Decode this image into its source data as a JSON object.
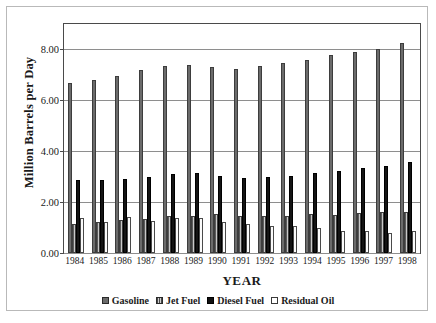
{
  "chart_data": {
    "type": "bar",
    "title": "",
    "xlabel": "YEAR",
    "ylabel": "Million Barrels per Day",
    "categories": [
      "1984",
      "1985",
      "1986",
      "1987",
      "1988",
      "1989",
      "1990",
      "1991",
      "1992",
      "1993",
      "1994",
      "1995",
      "1996",
      "1997",
      "1998"
    ],
    "ylim": [
      0.0,
      9.0
    ],
    "yticks": [
      "0.00",
      "2.00",
      "4.00",
      "6.00",
      "8.00"
    ],
    "ytick_values": [
      0.0,
      2.0,
      4.0,
      6.0,
      8.0
    ],
    "grid": true,
    "legend_position": "bottom",
    "series": [
      {
        "name": "Gasoline",
        "color": "#6b6b6b",
        "pattern": "solid-dark-gray",
        "values": [
          6.69,
          6.8,
          6.95,
          7.19,
          7.34,
          7.37,
          7.31,
          7.24,
          7.36,
          7.46,
          7.6,
          7.79,
          7.89,
          8.02,
          8.25
        ]
      },
      {
        "name": "Jet Fuel",
        "color": "#9a9a9a",
        "pattern": "vertical-hatch-gray",
        "values": [
          1.15,
          1.2,
          1.28,
          1.35,
          1.44,
          1.47,
          1.52,
          1.47,
          1.44,
          1.47,
          1.52,
          1.49,
          1.57,
          1.62,
          1.63
        ]
      },
      {
        "name": "Diesel Fuel",
        "color": "#141414",
        "pattern": "solid-black",
        "values": [
          2.85,
          2.87,
          2.92,
          2.98,
          3.1,
          3.14,
          3.03,
          2.93,
          2.98,
          3.04,
          3.15,
          3.21,
          3.36,
          3.43,
          3.58
        ]
      },
      {
        "name": "Residual Oil",
        "color": "#ffffff",
        "pattern": "open-white",
        "values": [
          1.38,
          1.22,
          1.41,
          1.25,
          1.36,
          1.36,
          1.21,
          1.15,
          1.07,
          1.05,
          1.0,
          0.86,
          0.85,
          0.8,
          0.86
        ]
      }
    ]
  }
}
